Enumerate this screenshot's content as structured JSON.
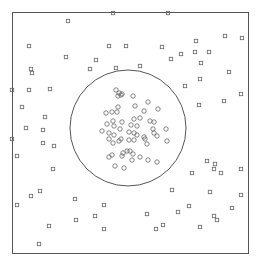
{
  "figure": {
    "width": 257,
    "height": 265,
    "frame": {
      "x": 12,
      "y": 12,
      "w": 236,
      "h": 241,
      "stroke": "#555555"
    },
    "boundary_circle": {
      "cx": 128,
      "cy": 128,
      "r": 58,
      "stroke": "#555555"
    },
    "marker_color": "#666666",
    "square_size": 3.4,
    "circle_r": 2.2
  },
  "outside_points_squares": [
    [
      68,
      21
    ],
    [
      113,
      13
    ],
    [
      168,
      13
    ],
    [
      29,
      46
    ],
    [
      66,
      57
    ],
    [
      96,
      60
    ],
    [
      109,
      46
    ],
    [
      126,
      46
    ],
    [
      31,
      69
    ],
    [
      32,
      73
    ],
    [
      90,
      69
    ],
    [
      116,
      68
    ],
    [
      12,
      90
    ],
    [
      29,
      90
    ],
    [
      50,
      89
    ],
    [
      22,
      107
    ],
    [
      45,
      117
    ],
    [
      26,
      128
    ],
    [
      43,
      130
    ],
    [
      43,
      143
    ],
    [
      12,
      139
    ],
    [
      17,
      156
    ],
    [
      54,
      146
    ],
    [
      53,
      169
    ],
    [
      31,
      196
    ],
    [
      40,
      191
    ],
    [
      17,
      205
    ],
    [
      75,
      199
    ],
    [
      49,
      226
    ],
    [
      76,
      220
    ],
    [
      104,
      205
    ],
    [
      95,
      216
    ],
    [
      104,
      229
    ],
    [
      39,
      244
    ],
    [
      162,
      47
    ],
    [
      196,
      41
    ],
    [
      209,
      52
    ],
    [
      225,
      36
    ],
    [
      181,
      54
    ],
    [
      195,
      52
    ],
    [
      242,
      38
    ],
    [
      140,
      66
    ],
    [
      171,
      59
    ],
    [
      201,
      63
    ],
    [
      200,
      79
    ],
    [
      229,
      72
    ],
    [
      185,
      86
    ],
    [
      241,
      94
    ],
    [
      224,
      101
    ],
    [
      199,
      105
    ],
    [
      214,
      169
    ],
    [
      207,
      161
    ],
    [
      215,
      164
    ],
    [
      192,
      173
    ],
    [
      221,
      173
    ],
    [
      241,
      169
    ],
    [
      172,
      190
    ],
    [
      210,
      192
    ],
    [
      241,
      195
    ],
    [
      189,
      206
    ],
    [
      232,
      208
    ],
    [
      147,
      214
    ],
    [
      178,
      212
    ],
    [
      214,
      216
    ],
    [
      217,
      220
    ],
    [
      163,
      225
    ],
    [
      200,
      227
    ],
    [
      156,
      229
    ]
  ],
  "inside_points_circles": [
    [
      116,
      90
    ],
    [
      119,
      93
    ],
    [
      121,
      95
    ],
    [
      118,
      96
    ],
    [
      122,
      94
    ],
    [
      133,
      96
    ],
    [
      148,
      102
    ],
    [
      106,
      113
    ],
    [
      112,
      112
    ],
    [
      118,
      107
    ],
    [
      135,
      106
    ],
    [
      117,
      112
    ],
    [
      144,
      111
    ],
    [
      158,
      109
    ],
    [
      107,
      124
    ],
    [
      113,
      121
    ],
    [
      114,
      126
    ],
    [
      122,
      122
    ],
    [
      137,
      126
    ],
    [
      134,
      119
    ],
    [
      140,
      118
    ],
    [
      131,
      125
    ],
    [
      150,
      121
    ],
    [
      154,
      122
    ],
    [
      153,
      129
    ],
    [
      102,
      131
    ],
    [
      109,
      133
    ],
    [
      120,
      129
    ],
    [
      114,
      135
    ],
    [
      129,
      132
    ],
    [
      134,
      133
    ],
    [
      137,
      135
    ],
    [
      154,
      133
    ],
    [
      121,
      139
    ],
    [
      119,
      141
    ],
    [
      109,
      139
    ],
    [
      113,
      143
    ],
    [
      129,
      140
    ],
    [
      134,
      140
    ],
    [
      144,
      137
    ],
    [
      147,
      144
    ],
    [
      145,
      139
    ],
    [
      157,
      136
    ],
    [
      166,
      129
    ],
    [
      167,
      141
    ],
    [
      112,
      155
    ],
    [
      123,
      153
    ],
    [
      127,
      151
    ],
    [
      130,
      151
    ],
    [
      133,
      154
    ],
    [
      122,
      156
    ],
    [
      109,
      157
    ],
    [
      140,
      157
    ],
    [
      132,
      160
    ],
    [
      148,
      160
    ],
    [
      157,
      162
    ],
    [
      124,
      168
    ],
    [
      115,
      166
    ]
  ]
}
